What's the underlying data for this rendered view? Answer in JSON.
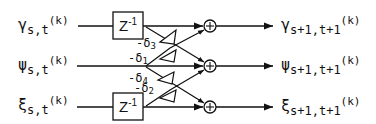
{
  "diagram": {
    "type": "lattice-filter-stage",
    "inputs": [
      {
        "symbol": "γ",
        "subscript": "s,t",
        "superscript": "(k)"
      },
      {
        "symbol": "ψ",
        "subscript": "s,t",
        "superscript": "(k)"
      },
      {
        "symbol": "ξ",
        "subscript": "s,t",
        "superscript": "(k)"
      }
    ],
    "outputs": [
      {
        "symbol": "γ",
        "subscript": "s+1,t+1",
        "superscript": "(k)"
      },
      {
        "symbol": "ψ",
        "subscript": "s+1,t+1",
        "superscript": "(k)"
      },
      {
        "symbol": "ξ",
        "subscript": "s+1,t+1",
        "superscript": "(k)"
      }
    ],
    "delays": [
      {
        "label": "Z",
        "exponent": "-1",
        "row": "γ"
      },
      {
        "label": "Z",
        "exponent": "-1",
        "row": "ξ"
      }
    ],
    "coefficients": [
      {
        "label": "-δ",
        "index": "3"
      },
      {
        "label": "-δ",
        "index": "1"
      },
      {
        "label": "-δ",
        "index": "4"
      },
      {
        "label": "-δ",
        "index": "2"
      }
    ],
    "adders": [
      {
        "symbol": "+"
      },
      {
        "symbol": "+"
      },
      {
        "symbol": "+"
      }
    ],
    "colors": {
      "ink": "#111111",
      "background": "#ffffff"
    }
  }
}
